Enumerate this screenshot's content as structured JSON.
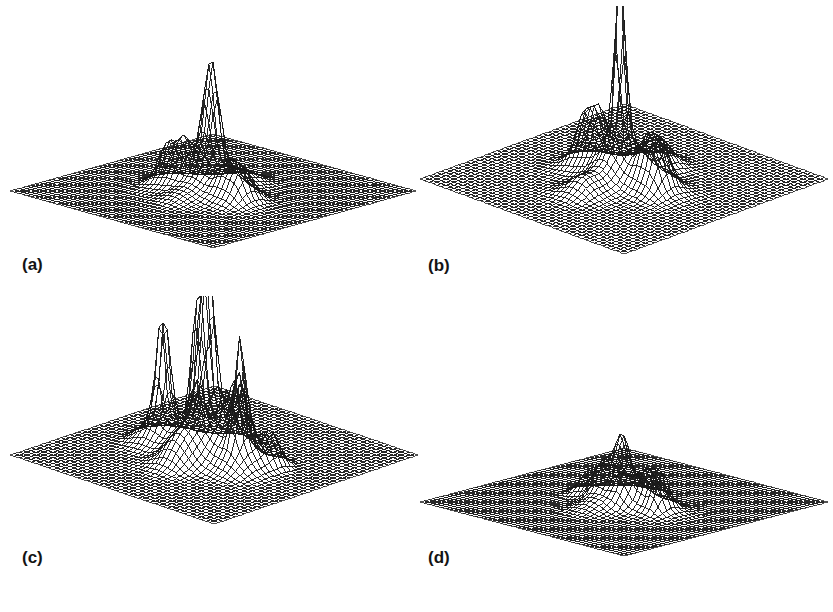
{
  "figure": {
    "kind": "four-panel-3d-surface-wireframe-figure",
    "background_color": "#ffffff",
    "mesh_color": "#1a1a1a",
    "surface_fill_color": "#ffffff",
    "panel_count": 4,
    "projection": "isometric-diamond",
    "grid_visible": true,
    "axes_visible": false,
    "tick_labels_visible": false,
    "legend_visible": false,
    "title": ""
  },
  "panels": [
    {
      "id": "a",
      "label": "(a)",
      "grid_n": 48,
      "peak_scale": 1.0
    },
    {
      "id": "b",
      "label": "(b)",
      "grid_n": 48,
      "peak_scale": 1.0
    },
    {
      "id": "c",
      "label": "(c)",
      "grid_n": 48,
      "peak_scale": 1.0
    },
    {
      "id": "d",
      "label": "(d)",
      "grid_n": 48,
      "peak_scale": 1.0
    }
  ],
  "chart_data": [
    {
      "type": "surface",
      "panel": "a",
      "title": "(a)",
      "xlabel": "",
      "ylabel": "",
      "zlabel": "",
      "xlim": [
        -1,
        1
      ],
      "ylim": [
        -1,
        1
      ],
      "zlim": [
        0,
        1
      ],
      "grid": true,
      "legend_position": "none",
      "description": "Single dominant central peak with several low side lobes arranged along the horizontal axis.",
      "peaks": [
        {
          "x": 0.0,
          "y": 0.02,
          "z": 1.0,
          "sx": 0.05,
          "sy": 0.06
        },
        {
          "x": 0.0,
          "y": 0.02,
          "z": 0.34,
          "sx": 0.14,
          "sy": 0.15
        },
        {
          "x": -0.34,
          "y": 0.1,
          "z": 0.3,
          "sx": 0.055,
          "sy": 0.075
        },
        {
          "x": -0.2,
          "y": 0.1,
          "z": 0.3,
          "sx": 0.055,
          "sy": 0.075
        },
        {
          "x": -0.27,
          "y": 0.1,
          "z": 0.14,
          "sx": 0.13,
          "sy": 0.13
        },
        {
          "x": 0.24,
          "y": 0.08,
          "z": 0.22,
          "sx": 0.06,
          "sy": 0.08
        },
        {
          "x": 0.37,
          "y": 0.08,
          "z": 0.24,
          "sx": 0.06,
          "sy": 0.08
        },
        {
          "x": 0.31,
          "y": 0.08,
          "z": 0.12,
          "sx": 0.14,
          "sy": 0.13
        },
        {
          "x": 0.02,
          "y": -0.3,
          "z": 0.1,
          "sx": 0.11,
          "sy": 0.1
        },
        {
          "x": 0.02,
          "y": 0.36,
          "z": 0.07,
          "sx": 0.11,
          "sy": 0.1
        }
      ]
    },
    {
      "type": "surface",
      "panel": "b",
      "title": "(b)",
      "xlabel": "",
      "ylabel": "",
      "zlabel": "",
      "xlim": [
        -1,
        1
      ],
      "ylim": [
        -1,
        1
      ],
      "zlim": [
        0,
        1
      ],
      "grid": true,
      "legend_position": "none",
      "description": "Very tall narrow central spike surrounded by a ring of low side lobes.",
      "peaks": [
        {
          "x": 0.0,
          "y": 0.04,
          "z": 1.0,
          "sx": 0.032,
          "sy": 0.04
        },
        {
          "x": 0.0,
          "y": 0.04,
          "z": 0.27,
          "sx": 0.12,
          "sy": 0.14
        },
        {
          "x": -0.36,
          "y": 0.02,
          "z": 0.2,
          "sx": 0.055,
          "sy": 0.07
        },
        {
          "x": -0.24,
          "y": 0.02,
          "z": 0.22,
          "sx": 0.055,
          "sy": 0.07
        },
        {
          "x": -0.3,
          "y": 0.02,
          "z": 0.11,
          "sx": 0.14,
          "sy": 0.13
        },
        {
          "x": 0.26,
          "y": 0.02,
          "z": 0.19,
          "sx": 0.055,
          "sy": 0.07
        },
        {
          "x": 0.38,
          "y": 0.02,
          "z": 0.2,
          "sx": 0.055,
          "sy": 0.07
        },
        {
          "x": 0.32,
          "y": 0.02,
          "z": 0.1,
          "sx": 0.14,
          "sy": 0.13
        },
        {
          "x": 0.0,
          "y": -0.32,
          "z": 0.16,
          "sx": 0.11,
          "sy": 0.1
        },
        {
          "x": 0.0,
          "y": 0.4,
          "z": 0.09,
          "sx": 0.11,
          "sy": 0.1
        }
      ]
    },
    {
      "type": "surface",
      "panel": "c",
      "title": "(c)",
      "xlabel": "",
      "ylabel": "",
      "zlabel": "",
      "xlim": [
        -1,
        1
      ],
      "ylim": [
        -1,
        1
      ],
      "zlim": [
        0,
        1
      ],
      "grid": true,
      "legend_position": "none",
      "description": "Many tall spikes of comparable height: a central cluster of three plus two isolated outer spikes and several medium lobes.",
      "peaks": [
        {
          "x": 0.0,
          "y": 0.06,
          "z": 1.0,
          "sx": 0.04,
          "sy": 0.05
        },
        {
          "x": -0.1,
          "y": 0.06,
          "z": 0.74,
          "sx": 0.034,
          "sy": 0.045
        },
        {
          "x": 0.0,
          "y": 0.06,
          "z": 0.4,
          "sx": 0.15,
          "sy": 0.15
        },
        {
          "x": -0.44,
          "y": 0.06,
          "z": 0.66,
          "sx": 0.036,
          "sy": 0.048
        },
        {
          "x": -0.44,
          "y": 0.06,
          "z": 0.24,
          "sx": 0.12,
          "sy": 0.12
        },
        {
          "x": 0.34,
          "y": 0.08,
          "z": 0.64,
          "sx": 0.034,
          "sy": 0.045
        },
        {
          "x": 0.34,
          "y": 0.08,
          "z": 0.22,
          "sx": 0.12,
          "sy": 0.12
        },
        {
          "x": 0.16,
          "y": -0.08,
          "z": 0.4,
          "sx": 0.04,
          "sy": 0.055
        },
        {
          "x": -0.26,
          "y": -0.1,
          "z": 0.34,
          "sx": 0.045,
          "sy": 0.06
        },
        {
          "x": 0.06,
          "y": -0.22,
          "z": 0.38,
          "sx": 0.05,
          "sy": 0.06
        },
        {
          "x": -0.12,
          "y": -0.24,
          "z": 0.32,
          "sx": 0.05,
          "sy": 0.06
        },
        {
          "x": 0.46,
          "y": -0.1,
          "z": 0.2,
          "sx": 0.06,
          "sy": 0.07
        },
        {
          "x": -0.02,
          "y": 0.34,
          "z": 0.14,
          "sx": 0.11,
          "sy": 0.1
        }
      ]
    },
    {
      "type": "surface",
      "panel": "d",
      "title": "(d)",
      "xlabel": "",
      "ylabel": "",
      "zlabel": "",
      "xlim": [
        -1,
        1
      ],
      "ylim": [
        -1,
        1
      ],
      "zlim": [
        0,
        1
      ],
      "grid": true,
      "legend_position": "none",
      "description": "Low diffuse cluster of modest peaks near the centre, none dominant.",
      "peaks": [
        {
          "x": 0.02,
          "y": 0.04,
          "z": 0.54,
          "sx": 0.045,
          "sy": 0.058
        },
        {
          "x": 0.02,
          "y": 0.04,
          "z": 0.26,
          "sx": 0.13,
          "sy": 0.13
        },
        {
          "x": -0.1,
          "y": 0.1,
          "z": 0.3,
          "sx": 0.06,
          "sy": 0.075
        },
        {
          "x": 0.14,
          "y": 0.1,
          "z": 0.3,
          "sx": 0.06,
          "sy": 0.075
        },
        {
          "x": -0.32,
          "y": 0.02,
          "z": 0.24,
          "sx": 0.07,
          "sy": 0.085
        },
        {
          "x": -0.2,
          "y": 0.02,
          "z": 0.22,
          "sx": 0.07,
          "sy": 0.085
        },
        {
          "x": 0.28,
          "y": 0.02,
          "z": 0.34,
          "sx": 0.05,
          "sy": 0.065
        },
        {
          "x": 0.4,
          "y": 0.04,
          "z": 0.38,
          "sx": 0.044,
          "sy": 0.058
        },
        {
          "x": 0.34,
          "y": 0.02,
          "z": 0.16,
          "sx": 0.13,
          "sy": 0.12
        },
        {
          "x": 0.04,
          "y": -0.2,
          "z": 0.3,
          "sx": 0.06,
          "sy": 0.07
        },
        {
          "x": -0.14,
          "y": -0.16,
          "z": 0.18,
          "sx": 0.08,
          "sy": 0.08
        },
        {
          "x": 0.0,
          "y": 0.3,
          "z": 0.1,
          "sx": 0.11,
          "sy": 0.1
        }
      ]
    }
  ]
}
